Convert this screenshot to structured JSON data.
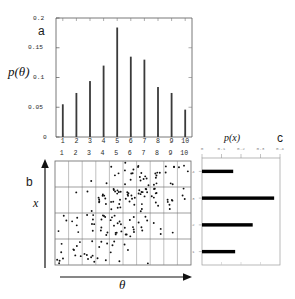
{
  "figure": {
    "panels": [
      {
        "id": "a",
        "letter": "a"
      },
      {
        "id": "b",
        "letter": "b"
      },
      {
        "id": "c",
        "letter": "c"
      }
    ]
  },
  "panel_a": {
    "letter": "a",
    "ylabel": "p(θ)",
    "ytick_labels": [
      "0",
      "0.05",
      "0.1",
      "0.15",
      "0.2"
    ],
    "xtick_labels": [
      "1",
      "2",
      "3",
      "4",
      "5",
      "6",
      "7",
      "8",
      "9",
      "10"
    ]
  },
  "panel_b": {
    "letter": "b",
    "ylabel": "x",
    "xlabel": "θ",
    "xtick_labels": [
      "1",
      "2",
      "3",
      "4",
      "5",
      "6",
      "7",
      "8",
      "9",
      "10"
    ]
  },
  "panel_c": {
    "letter": "c",
    "title": "p(x)",
    "xtick_labels": [
      "0",
      "0.1",
      "0.2",
      "0.3",
      "0.4"
    ],
    "ytick_labels": [
      "4",
      "3",
      "2",
      "1"
    ]
  },
  "chart_data": [
    {
      "type": "bar",
      "panel": "a",
      "title": "",
      "xlabel": "θ",
      "ylabel": "p(θ)",
      "categories": [
        "1",
        "2",
        "3",
        "4",
        "5",
        "6",
        "7",
        "8",
        "9",
        "10"
      ],
      "values": [
        0.055,
        0.074,
        0.094,
        0.12,
        0.184,
        0.135,
        0.13,
        0.084,
        0.074,
        0.046
      ],
      "ylim": [
        0,
        0.2
      ],
      "yticks": [
        0,
        0.05,
        0.1,
        0.15,
        0.2
      ],
      "grid": false,
      "orientation": "vertical",
      "bar_color": "#3a3a3a"
    },
    {
      "type": "scatter",
      "panel": "b",
      "title": "",
      "xlabel": "θ",
      "ylabel": "x",
      "xlim": [
        0,
        10
      ],
      "ylim": [
        0,
        4
      ],
      "grid": true,
      "grid_columns": 10,
      "grid_rows": 4,
      "point_color": "#111111",
      "note": "joint samples of (theta, x); density highest in mid columns",
      "cell_counts": [
        {
          "row": 4,
          "counts": [
            0,
            0,
            1,
            1,
            3,
            7,
            9,
            7,
            6,
            3
          ]
        },
        {
          "row": 3,
          "counts": [
            0,
            1,
            2,
            9,
            14,
            10,
            12,
            8,
            6,
            3
          ]
        },
        {
          "row": 2,
          "counts": [
            3,
            4,
            6,
            8,
            11,
            9,
            5,
            3,
            1,
            0
          ]
        },
        {
          "row": 1,
          "counts": [
            6,
            6,
            7,
            5,
            4,
            2,
            1,
            0,
            0,
            0
          ]
        }
      ]
    },
    {
      "type": "bar",
      "panel": "c",
      "title": "p(x)",
      "xlabel": "p(x)",
      "ylabel": "x",
      "categories": [
        "4",
        "3",
        "2",
        "1"
      ],
      "values": [
        0.16,
        0.37,
        0.26,
        0.17
      ],
      "xlim": [
        0,
        0.4
      ],
      "xticks": [
        0,
        0.1,
        0.2,
        0.3,
        0.4
      ],
      "grid": false,
      "orientation": "horizontal",
      "bar_color": "#000000"
    }
  ]
}
